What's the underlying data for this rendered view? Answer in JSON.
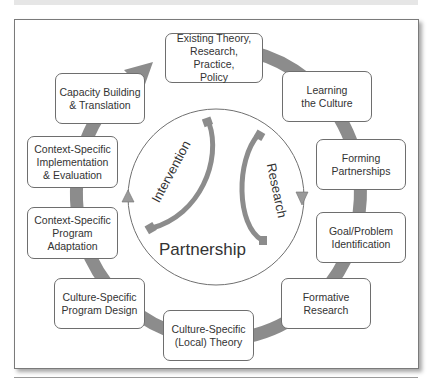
{
  "diagram": {
    "center": {
      "title": "Partnership",
      "left_arc_label": "Intervention",
      "right_arc_label": "Research"
    },
    "cycle_steps": [
      {
        "id": "existing-theory",
        "label": "Existing Theory,\nResearch, Practice,\nPolicy"
      },
      {
        "id": "learning-culture",
        "label": "Learning\nthe Culture"
      },
      {
        "id": "forming-partnerships",
        "label": "Forming\nPartnerships"
      },
      {
        "id": "goal-problem",
        "label": "Goal/Problem\nIdentification"
      },
      {
        "id": "formative-research",
        "label": "Formative\nResearch"
      },
      {
        "id": "culture-specific-theory",
        "label": "Culture-Specific\n(Local) Theory"
      },
      {
        "id": "culture-specific-design",
        "label": "Culture-Specific\nProgram Design"
      },
      {
        "id": "context-specific-adaptation",
        "label": "Context-Specific\nProgram\nAdaptation"
      },
      {
        "id": "context-specific-implementation",
        "label": "Context-Specific\nImplementation\n& Evaluation"
      },
      {
        "id": "capacity-building",
        "label": "Capacity Building\n& Translation"
      }
    ],
    "colors": {
      "ring": "#8c8c8c",
      "box_border": "#6e6e6e",
      "text": "#333333",
      "circle": "#707070"
    }
  }
}
